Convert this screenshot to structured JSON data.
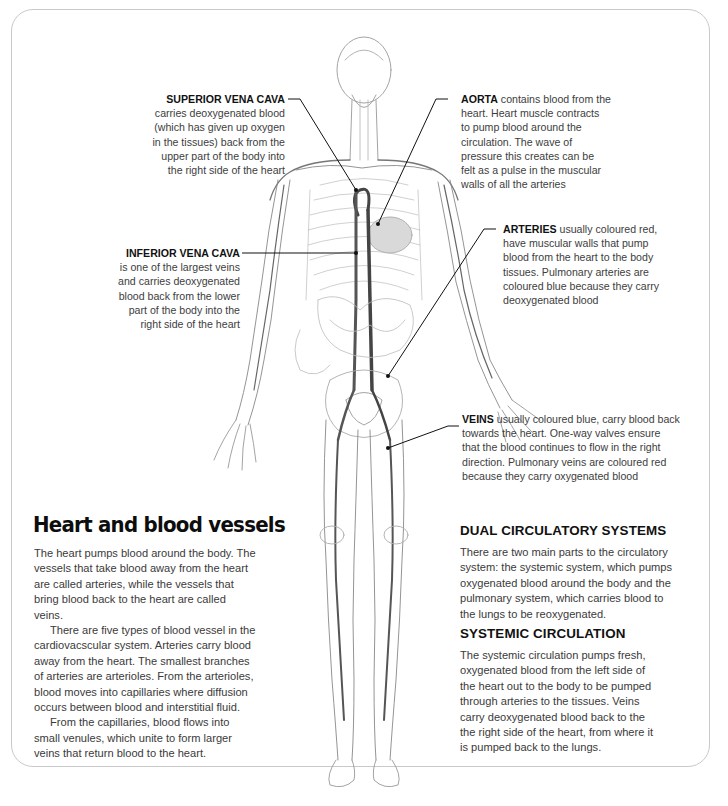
{
  "page": {
    "title": "Heart and blood vessels",
    "intro_paragraphs": [
      "The heart pumps blood around the body. The vessels that take blood away from the heart are called arteries, while the vessels that bring blood back to the heart are called veins.",
      "There are five types of blood vessel in the cardiovacscular system. Arteries carry blood away from the heart. The smallest branches of arteries are arterioles. From the arterioles, blood moves into capillaries where diffusion occurs between blood and interstitial fluid.",
      "From the capillaries, blood flows into small venules, which unite to form larger veins that return blood to the heart."
    ],
    "sections": [
      {
        "heading": "DUAL CIRCULATORY SYSTEMS",
        "text": "There are two main parts to the circulatory system: the systemic system, which pumps oxygenated blood around the body and the pulmonary system, which carries blood to the lungs to be reoxygenated."
      },
      {
        "heading": "SYSTEMIC CIRCULATION",
        "text": "The systemic circulation pumps fresh, oxygenated blood from the left side of the heart out to the body to be pumped through arteries to the tissues. Veins carry deoxygenated blood back to the the right side of the heart, from where it is pumped back to the lungs."
      }
    ]
  },
  "figure": {
    "callouts": [
      {
        "term": "SUPERIOR VENA CAVA",
        "lines": [
          "carries deoxygenated blood",
          "(which has given up oxygen",
          "in the tissues) back from the",
          "upper part of the body into",
          "the right side of the heart"
        ]
      },
      {
        "term": "AORTA",
        "lines": [
          "contains blood from the",
          "heart. Heart muscle contracts",
          "to pump blood around the",
          "circulation. The wave of",
          "pressure this creates can be",
          "felt as a pulse in the muscular",
          "walls of all the arteries"
        ]
      },
      {
        "term": "INFERIOR VENA CAVA",
        "lines": [
          "is one of the largest veins",
          "and carries deoxygenated",
          "blood back from the lower",
          "part of the body into the",
          "right side of the heart"
        ]
      },
      {
        "term": "ARTERIES",
        "lines": [
          "usually coloured red,",
          "have muscular walls that pump",
          "blood from the heart to the body",
          "tissues. Pulmonary arteries are",
          "coloured blue because they carry",
          "deoxygenated blood"
        ]
      },
      {
        "term": "VEINS",
        "lines": [
          "usually coloured blue, carry blood back",
          "towards the heart. One-way valves ensure",
          "that the blood continues to flow in the right",
          "direction. Pulmonary veins are coloured red",
          "because they carry oxygenated blood"
        ]
      }
    ]
  }
}
